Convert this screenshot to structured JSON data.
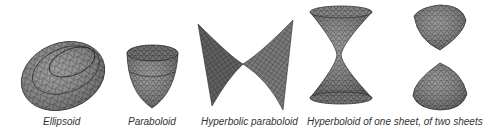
{
  "figure": {
    "surfaces": [
      {
        "id": "ellipsoid",
        "caption": "Ellipsoid"
      },
      {
        "id": "paraboloid",
        "caption": "Paraboloid"
      },
      {
        "id": "hyperbolic-paraboloid",
        "caption": "Hyperbolic paraboloid"
      },
      {
        "id": "hyperboloids",
        "caption": "Hyperboloid of one sheet, of two sheets"
      }
    ],
    "colors": {
      "surface_fill": "#8a8a8a",
      "surface_dark": "#5a5a5a",
      "mesh_line": "#2a2a2a",
      "caption_text": "#333333",
      "background": "#ffffff"
    }
  }
}
